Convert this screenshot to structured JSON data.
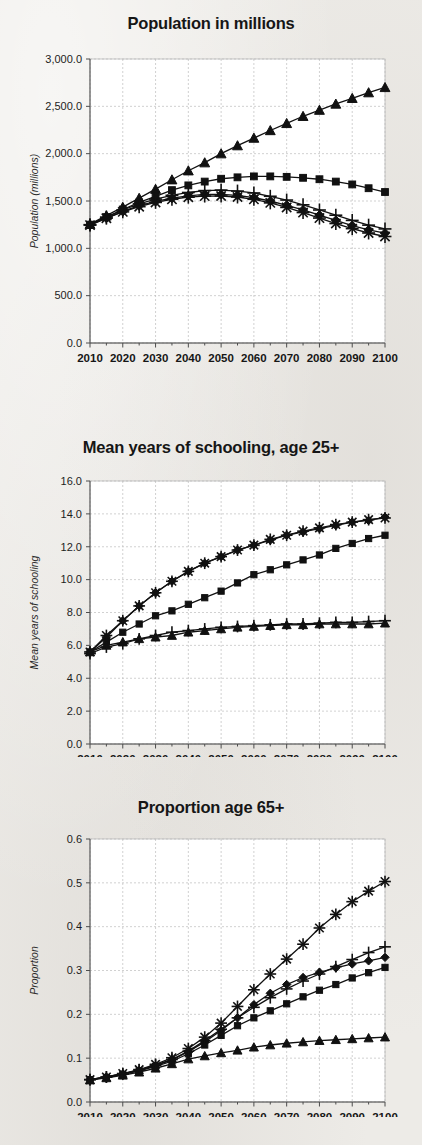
{
  "page": {
    "background_color": "#edebe7",
    "ink_color": "#111111"
  },
  "legend": {
    "entries": [
      {
        "label": "SSP1",
        "marker": "diamond"
      },
      {
        "label": "SSP2",
        "marker": "square"
      },
      {
        "label": "SSP3",
        "marker": "triangle"
      },
      {
        "label": "SSP4",
        "marker": "plus"
      },
      {
        "label": "SSP5",
        "marker": "asterisk"
      }
    ]
  },
  "chart_data": [
    {
      "type": "line",
      "title": "Population in millions",
      "xlabel": "",
      "ylabel": "Population (millions)",
      "ylim": [
        0,
        3000
      ],
      "yticks": [
        0,
        500,
        1000,
        1500,
        2000,
        2500,
        3000
      ],
      "ytick_labels": [
        "0.0",
        "500.0",
        "1,000.0",
        "1,500.0",
        "2,000.0",
        "2,500.0",
        "3,000.0"
      ],
      "xlim": [
        2010,
        2100
      ],
      "xticks": [
        2010,
        2020,
        2030,
        2040,
        2050,
        2060,
        2070,
        2080,
        2090,
        2100
      ],
      "xtick_labels": [
        "2010",
        "2020",
        "2030",
        "2040",
        "2050",
        "2060",
        "2070",
        "2080",
        "2090",
        "2100"
      ],
      "grid": true,
      "legend_position": "bottom",
      "x": [
        2010,
        2015,
        2020,
        2025,
        2030,
        2035,
        2040,
        2045,
        2050,
        2055,
        2060,
        2065,
        2070,
        2075,
        2080,
        2085,
        2090,
        2095,
        2100
      ],
      "series": [
        {
          "name": "SSP1",
          "marker": "diamond",
          "values": [
            1245,
            1320,
            1390,
            1450,
            1495,
            1530,
            1555,
            1570,
            1570,
            1560,
            1535,
            1500,
            1455,
            1405,
            1350,
            1295,
            1240,
            1195,
            1160
          ]
        },
        {
          "name": "SSP2",
          "marker": "square",
          "values": [
            1250,
            1330,
            1410,
            1485,
            1550,
            1615,
            1665,
            1705,
            1735,
            1750,
            1760,
            1760,
            1755,
            1745,
            1730,
            1705,
            1675,
            1635,
            1595
          ]
        },
        {
          "name": "SSP3",
          "marker": "triangle",
          "values": [
            1255,
            1345,
            1435,
            1530,
            1625,
            1725,
            1820,
            1905,
            2000,
            2085,
            2165,
            2245,
            2320,
            2395,
            2460,
            2525,
            2585,
            2645,
            2700
          ]
        },
        {
          "name": "SSP4",
          "marker": "plus",
          "values": [
            1250,
            1330,
            1405,
            1470,
            1520,
            1560,
            1590,
            1610,
            1615,
            1605,
            1585,
            1550,
            1510,
            1460,
            1405,
            1350,
            1295,
            1245,
            1205
          ]
        },
        {
          "name": "SSP5",
          "marker": "asterisk",
          "values": [
            1245,
            1318,
            1385,
            1440,
            1485,
            1518,
            1540,
            1552,
            1553,
            1542,
            1518,
            1480,
            1432,
            1378,
            1320,
            1262,
            1208,
            1162,
            1125
          ]
        }
      ]
    },
    {
      "type": "line",
      "title": "Mean years of schooling, age 25+",
      "xlabel": "",
      "ylabel": "Mean years of schooling",
      "ylim": [
        0,
        16
      ],
      "yticks": [
        0,
        2,
        4,
        6,
        8,
        10,
        12,
        14,
        16
      ],
      "ytick_labels": [
        "0.0",
        "2.0",
        "4.0",
        "6.0",
        "8.0",
        "10.0",
        "12.0",
        "14.0",
        "16.0"
      ],
      "xlim": [
        2010,
        2100
      ],
      "xticks": [
        2010,
        2020,
        2030,
        2040,
        2050,
        2060,
        2070,
        2080,
        2090,
        2100
      ],
      "xtick_labels": [
        "2010",
        "2020",
        "2030",
        "2040",
        "2050",
        "2060",
        "2070",
        "2080",
        "2090",
        "2100"
      ],
      "grid": true,
      "legend_position": "none",
      "x": [
        2010,
        2015,
        2020,
        2025,
        2030,
        2035,
        2040,
        2045,
        2050,
        2055,
        2060,
        2065,
        2070,
        2075,
        2080,
        2085,
        2090,
        2095,
        2100
      ],
      "series": [
        {
          "name": "SSP1",
          "marker": "diamond",
          "values": [
            5.6,
            6.5,
            7.5,
            8.4,
            9.2,
            9.9,
            10.5,
            11.0,
            11.4,
            11.8,
            12.1,
            12.4,
            12.7,
            12.9,
            13.1,
            13.3,
            13.5,
            13.6,
            13.8
          ]
        },
        {
          "name": "SSP2",
          "marker": "square",
          "values": [
            5.6,
            6.2,
            6.8,
            7.3,
            7.8,
            8.1,
            8.5,
            8.9,
            9.3,
            9.8,
            10.3,
            10.6,
            10.9,
            11.2,
            11.5,
            11.9,
            12.2,
            12.5,
            12.7
          ]
        },
        {
          "name": "SSP3",
          "marker": "triangle",
          "values": [
            5.6,
            6.0,
            6.2,
            6.4,
            6.5,
            6.6,
            6.8,
            6.9,
            7.0,
            7.1,
            7.15,
            7.2,
            7.25,
            7.25,
            7.3,
            7.3,
            7.3,
            7.3,
            7.35
          ]
        },
        {
          "name": "SSP4",
          "marker": "plus",
          "values": [
            5.5,
            5.9,
            6.1,
            6.4,
            6.6,
            6.8,
            6.9,
            7.0,
            7.1,
            7.15,
            7.2,
            7.25,
            7.3,
            7.3,
            7.35,
            7.4,
            7.4,
            7.45,
            7.5
          ]
        },
        {
          "name": "SSP5",
          "marker": "asterisk",
          "values": [
            5.6,
            6.6,
            7.5,
            8.4,
            9.2,
            9.9,
            10.5,
            11.0,
            11.4,
            11.8,
            12.1,
            12.45,
            12.7,
            12.95,
            13.15,
            13.35,
            13.5,
            13.65,
            13.75
          ]
        }
      ]
    },
    {
      "type": "line",
      "title": "Proportion age 65+",
      "xlabel": "",
      "ylabel": "Proportion",
      "ylim": [
        0,
        0.6
      ],
      "yticks": [
        0,
        0.1,
        0.2,
        0.3,
        0.4,
        0.5,
        0.6
      ],
      "ytick_labels": [
        "0.0",
        "0.1",
        "0.2",
        "0.3",
        "0.4",
        "0.5",
        "0.6"
      ],
      "xlim": [
        2010,
        2100
      ],
      "xticks": [
        2010,
        2020,
        2030,
        2040,
        2050,
        2060,
        2070,
        2080,
        2090,
        2100
      ],
      "xtick_labels": [
        "2010",
        "2020",
        "2030",
        "2040",
        "2050",
        "2060",
        "2070",
        "2080",
        "2090",
        "2100"
      ],
      "grid": true,
      "legend_position": "none",
      "x": [
        2010,
        2015,
        2020,
        2025,
        2030,
        2035,
        2040,
        2045,
        2050,
        2055,
        2060,
        2065,
        2070,
        2075,
        2080,
        2085,
        2090,
        2095,
        2100
      ],
      "series": [
        {
          "name": "SSP1",
          "marker": "diamond",
          "values": [
            0.051,
            0.057,
            0.064,
            0.072,
            0.083,
            0.096,
            0.115,
            0.137,
            0.163,
            0.192,
            0.222,
            0.248,
            0.268,
            0.284,
            0.296,
            0.306,
            0.315,
            0.322,
            0.33
          ]
        },
        {
          "name": "SSP2",
          "marker": "square",
          "values": [
            0.051,
            0.056,
            0.063,
            0.071,
            0.081,
            0.093,
            0.11,
            0.13,
            0.152,
            0.174,
            0.192,
            0.208,
            0.224,
            0.24,
            0.255,
            0.268,
            0.283,
            0.295,
            0.307
          ]
        },
        {
          "name": "SSP3",
          "marker": "triangle",
          "values": [
            0.05,
            0.055,
            0.061,
            0.068,
            0.077,
            0.087,
            0.098,
            0.105,
            0.112,
            0.118,
            0.125,
            0.13,
            0.134,
            0.137,
            0.14,
            0.142,
            0.144,
            0.146,
            0.148
          ]
        },
        {
          "name": "SSP4",
          "marker": "plus",
          "values": [
            0.051,
            0.057,
            0.064,
            0.073,
            0.084,
            0.097,
            0.116,
            0.14,
            0.166,
            0.192,
            0.216,
            0.238,
            0.258,
            0.276,
            0.292,
            0.309,
            0.325,
            0.341,
            0.354
          ]
        },
        {
          "name": "SSP5",
          "marker": "asterisk",
          "values": [
            0.051,
            0.057,
            0.065,
            0.074,
            0.086,
            0.101,
            0.122,
            0.148,
            0.18,
            0.218,
            0.256,
            0.292,
            0.326,
            0.36,
            0.397,
            0.428,
            0.457,
            0.481,
            0.503
          ]
        }
      ]
    }
  ]
}
